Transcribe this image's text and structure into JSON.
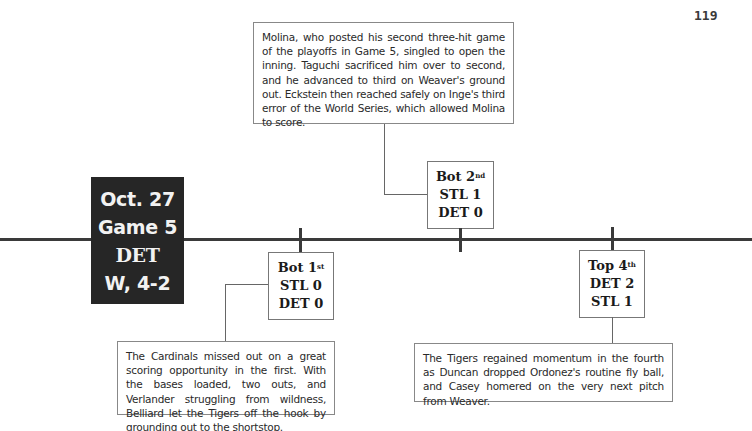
{
  "page_number": "119",
  "game": {
    "date": "Oct. 27",
    "game": "Game 5",
    "winner": "DET",
    "result": "W, 4-2"
  },
  "events": [
    {
      "inning_half": "Bot",
      "inning_num": "1",
      "inning_suffix": "st",
      "line1": "STL 0",
      "line2": "DET 0",
      "note": "The Cardinals missed out on a great scoring opportunity in the first. With the bases loaded, two outs, and Verlander struggling from wildness, Belliard let the Tigers off the hook by grounding out to the shortstop."
    },
    {
      "inning_half": "Bot",
      "inning_num": "2",
      "inning_suffix": "nd",
      "line1": "STL 1",
      "line2": "DET 0",
      "note": "Molina, who posted his second three-hit game of the playoffs in Game 5, singled to open the inning. Taguchi sacrificed him over to second, and he advanced to third on Weaver's ground out. Eckstein then reached safely on Inge's third error of the World Series, which allowed Molina to score."
    },
    {
      "inning_half": "Top",
      "inning_num": "4",
      "inning_suffix": "th",
      "line1": "DET 2",
      "line2": "STL 1",
      "note": "The Tigers regained momentum in the fourth as Duncan dropped Ordonez's routine fly ball, and Casey homered on the very next pitch from Weaver."
    }
  ]
}
